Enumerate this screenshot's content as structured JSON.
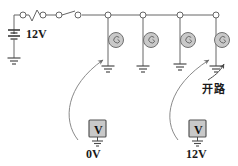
{
  "diagram": {
    "colors": {
      "wire": "#666666",
      "node_fill": "#ffffff",
      "lamp_fill": "#c9c9c9",
      "lamp_stroke": "#707070",
      "meter_fill": "#c9c9c9",
      "meter_stroke": "#555555",
      "text": "#1a1a1a",
      "probe": "#8a8a8a"
    },
    "source": {
      "type": "battery",
      "label": "12V",
      "has_ground": true
    },
    "series_elements": [
      {
        "name": "fuse",
        "symbol": "zigzag"
      },
      {
        "name": "switch",
        "symbol": "open-contact"
      }
    ],
    "rail_nodes": 8,
    "branches": [
      {
        "index": 1,
        "component": "lamp",
        "x": 108,
        "grounded": true,
        "probed": true,
        "probe_meter": "voltmeter-left"
      },
      {
        "index": 2,
        "component": "lamp",
        "x": 143,
        "grounded": true,
        "probed": false
      },
      {
        "index": 3,
        "component": "lamp",
        "x": 180,
        "grounded": true,
        "probed": false
      },
      {
        "index": 4,
        "component": "lamp",
        "x": 216,
        "grounded": true,
        "probed": true,
        "probe_meter": "voltmeter-right"
      }
    ],
    "annotations": [
      {
        "name": "open-circuit-callout",
        "text": "开路",
        "points_to": "branch-4-lower-wire"
      }
    ],
    "meters": [
      {
        "name": "voltmeter-left",
        "glyph": "V",
        "reading": "0V",
        "grounded": true
      },
      {
        "name": "voltmeter-right",
        "glyph": "V",
        "reading": "12V",
        "grounded": true
      }
    ]
  }
}
